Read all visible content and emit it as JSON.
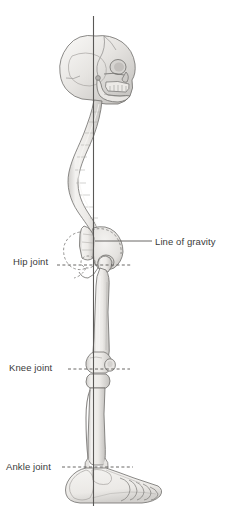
{
  "figure": {
    "view": "lateral-right",
    "background_color": "#ffffff",
    "bone_fill": "#efeeec",
    "bone_shade": "#c9c7c4",
    "bone_outline": "#6f6d6b",
    "label_color": "#3a3a3a",
    "leader_color": "#5a5856",
    "gravity_line_color": "#5a5856"
  },
  "labels": {
    "line_of_gravity": "Line of gravity",
    "hip_joint": "Hip joint",
    "knee_joint": "Knee joint",
    "ankle_joint": "Ankle joint"
  },
  "leaders": {
    "line_of_gravity": {
      "style": "solid",
      "x1": 95,
      "y1": 241,
      "x2": 152,
      "y2": 241
    },
    "hip_joint": {
      "style": "dashed",
      "x1": 57,
      "y1": 265,
      "x2": 131,
      "y2": 265
    },
    "knee_joint": {
      "style": "dashed",
      "x1": 68,
      "y1": 369,
      "x2": 130,
      "y2": 369
    },
    "ankle_joint": {
      "style": "dashed",
      "x1": 62,
      "y1": 467,
      "x2": 133,
      "y2": 467
    }
  },
  "gravity_line": {
    "x": 93,
    "y_top": 16,
    "y_bottom": 506
  },
  "anatomy_parts": [
    "skull",
    "mandible",
    "cervical-spine",
    "thoracic-spine",
    "lumbar-spine",
    "sacrum",
    "pelvis",
    "femur",
    "patella",
    "tibia",
    "fibula",
    "talus",
    "calcaneus",
    "foot"
  ]
}
